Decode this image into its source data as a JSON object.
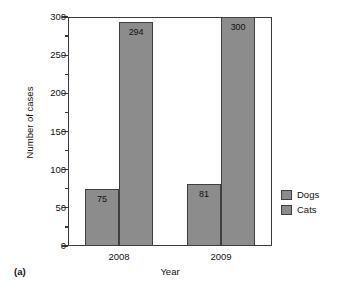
{
  "caption": "(a)",
  "legend": {
    "position": "right",
    "items": [
      {
        "label": "Dogs",
        "color": "#8c8c8c"
      },
      {
        "label": "Cats",
        "color": "#8c8c8c"
      }
    ]
  },
  "axes": {
    "y_title": "Number of cases",
    "x_title": "Year",
    "y_tick_labels": [
      "300",
      "250",
      "200",
      "150",
      "100",
      "50",
      "0"
    ],
    "x_tick_labels": [
      "2008",
      "2009"
    ]
  },
  "chart_data": {
    "type": "bar",
    "title": "",
    "subtitle": "",
    "xlabel": "Year",
    "ylabel": "Number of cases",
    "categories": [
      "2008",
      "2009"
    ],
    "series": [
      {
        "name": "Dogs",
        "values": [
          75,
          81
        ],
        "color": "#8c8c8c"
      },
      {
        "name": "Cats",
        "values": [
          294,
          300
        ],
        "color": "#8c8c8c"
      }
    ],
    "data_labels": [
      "75",
      "294",
      "81",
      "300"
    ],
    "ylim": [
      0,
      300
    ],
    "ytick_major_step": 50,
    "ytick_minor_step": 25,
    "grid": false,
    "legend_position": "right",
    "annotation": "(a)"
  }
}
